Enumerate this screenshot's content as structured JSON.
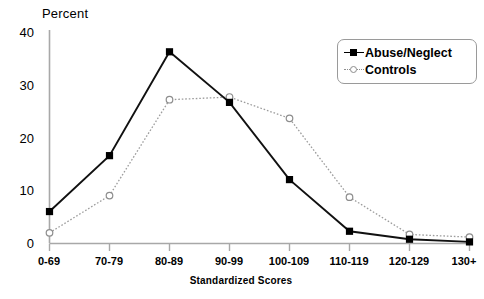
{
  "chart_data": {
    "type": "line",
    "title": "",
    "xlabel": "Standardized Scores",
    "ylabel": "Percent",
    "ylim": [
      0,
      40
    ],
    "yticks": [
      0,
      10,
      20,
      30,
      40
    ],
    "grid": false,
    "legend_position": "top-right",
    "categories": [
      "0-69",
      "70-79",
      "80-89",
      "90-99",
      "100-109",
      "110-119",
      "120-129",
      "130+"
    ],
    "series": [
      {
        "name": "Abuse/Neglect",
        "marker": "filled-square",
        "line_style": "solid",
        "color": "#000000",
        "values": [
          6,
          16.5,
          36,
          26.5,
          12,
          2.3,
          0.8,
          0.3
        ]
      },
      {
        "name": "Controls",
        "marker": "open-circle",
        "line_style": "dotted",
        "color": "#8d8d8d",
        "values": [
          2,
          9,
          27,
          27.5,
          23.5,
          8.7,
          1.7,
          1.2
        ]
      }
    ]
  },
  "axis": {
    "y_title": "Percent",
    "x_title": "Standardized Scores",
    "y_tick_labels": [
      "40",
      "30",
      "20",
      "10",
      "0"
    ],
    "x_tick_labels": [
      "0-69",
      "70-79",
      "80-89",
      "90-99",
      "100-109",
      "110-119",
      "120-129",
      "130+"
    ]
  },
  "legend": {
    "items": [
      {
        "label": "Abuse/Neglect"
      },
      {
        "label": "Controls"
      }
    ]
  }
}
